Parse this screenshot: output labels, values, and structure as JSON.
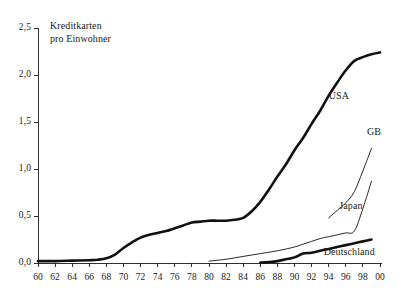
{
  "chart_data": {
    "type": "line",
    "title": "Kreditkarten\npro Einwohner",
    "title_line1": "Kreditkarten",
    "title_line2": "pro Einwohner",
    "xlabel": "",
    "ylabel": "Kreditkarten pro Einwohner",
    "xlim": [
      1960,
      2000
    ],
    "ylim": [
      0.0,
      2.5
    ],
    "grid": false,
    "legend": "inline-labels",
    "x_tick_labels": [
      "60",
      "62",
      "64",
      "66",
      "68",
      "70",
      "72",
      "74",
      "76",
      "78",
      "80",
      "82",
      "84",
      "86",
      "88",
      "90",
      "92",
      "94",
      "96",
      "98",
      "00"
    ],
    "x_tick_values": [
      1960,
      1962,
      1964,
      1966,
      1968,
      1970,
      1972,
      1974,
      1976,
      1978,
      1980,
      1982,
      1984,
      1986,
      1988,
      1990,
      1992,
      1994,
      1996,
      1998,
      2000
    ],
    "y_tick_labels": [
      "0,0",
      "0,5",
      "1,0",
      "1,5",
      "2,0",
      "2,5"
    ],
    "y_tick_values": [
      0.0,
      0.5,
      1.0,
      1.5,
      2.0,
      2.5
    ],
    "series": [
      {
        "name": "USA",
        "label": "USA",
        "style": "thick",
        "label_x": 1995.2,
        "label_y": 1.78,
        "x": [
          1960,
          1962,
          1964,
          1966,
          1967,
          1968,
          1969,
          1970,
          1971,
          1972,
          1973,
          1974,
          1975,
          1976,
          1977,
          1978,
          1979,
          1980,
          1981,
          1982,
          1983,
          1984,
          1985,
          1986,
          1987,
          1988,
          1989,
          1990,
          1991,
          1992,
          1993,
          1994,
          1995,
          1996,
          1997,
          1998,
          1999,
          2000
        ],
        "values": [
          0.02,
          0.02,
          0.025,
          0.03,
          0.035,
          0.05,
          0.09,
          0.16,
          0.22,
          0.27,
          0.3,
          0.32,
          0.34,
          0.37,
          0.4,
          0.43,
          0.44,
          0.45,
          0.45,
          0.45,
          0.46,
          0.48,
          0.55,
          0.65,
          0.78,
          0.92,
          1.05,
          1.2,
          1.33,
          1.48,
          1.62,
          1.78,
          1.92,
          2.05,
          2.15,
          2.19,
          2.22,
          2.24
        ]
      },
      {
        "name": "GB",
        "label": "GB",
        "style": "thin",
        "label_x": 1999.3,
        "label_y": 1.39,
        "x": [
          1994,
          1995,
          1996,
          1997,
          1998,
          1999
        ],
        "values": [
          0.48,
          0.56,
          0.64,
          0.76,
          0.98,
          1.22
        ]
      },
      {
        "name": "Japan",
        "label": "Japan",
        "style": "thin",
        "label_x": 1996.6,
        "label_y": 0.61,
        "x": [
          1980,
          1982,
          1984,
          1986,
          1988,
          1990,
          1991,
          1992,
          1993,
          1994,
          1995,
          1996,
          1997,
          1998,
          1999
        ],
        "values": [
          0.02,
          0.04,
          0.07,
          0.1,
          0.13,
          0.17,
          0.2,
          0.23,
          0.26,
          0.28,
          0.3,
          0.32,
          0.34,
          0.58,
          0.87
        ]
      },
      {
        "name": "Deutschland",
        "label": "Deutschland",
        "style": "thick",
        "label_x": 1996.4,
        "label_y": 0.115,
        "x": [
          1986,
          1987,
          1988,
          1989,
          1990,
          1991,
          1992,
          1993,
          1994,
          1995,
          1996,
          1997,
          1998,
          1999
        ],
        "values": [
          0.005,
          0.01,
          0.02,
          0.04,
          0.06,
          0.1,
          0.11,
          0.13,
          0.15,
          0.17,
          0.19,
          0.21,
          0.23,
          0.25
        ]
      }
    ]
  },
  "colors": {
    "ink": "#111111",
    "axis": "#1a1a1a",
    "background": "#ffffff"
  }
}
